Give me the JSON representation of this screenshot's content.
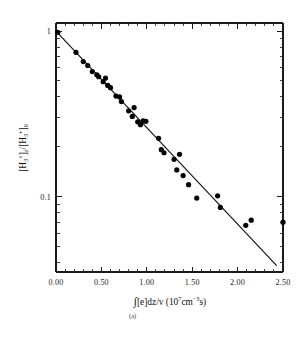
{
  "figure": {
    "caption": "(a)",
    "background_color": "#ffffff",
    "foreground_color": "#000000"
  },
  "axes": {
    "x": {
      "label_parts": {
        "integral": "∫",
        "body": "[e]dz/v  (10",
        "exp1": "7",
        "mid": "cm",
        "exp2": "−3",
        "tail": "s)"
      },
      "label_plain": "∫[e]dz/v (10⁷cm⁻³s)",
      "tick_labels": [
        "0.00",
        "0.50",
        "1.00",
        "1.50",
        "2.00",
        "2.50"
      ],
      "tick_values": [
        0.0,
        0.5,
        1.0,
        1.5,
        2.0,
        2.5
      ],
      "range": [
        0.0,
        2.5
      ],
      "scale": "linear",
      "minor_ticks_per_interval": 5
    },
    "y": {
      "label_plain": "[H₃⁺]z/[H₃⁺]₀",
      "label_parts": {
        "open1": "[H",
        "sub1": "3",
        "sup1": "+",
        "close1": "]",
        "subz": "z",
        "slash": "/[H",
        "sub2": "3",
        "sup2": "+",
        "close2": "]",
        "sub0": "0"
      },
      "tick_labels": [
        "1",
        "0.1"
      ],
      "tick_values": [
        1.0,
        0.1
      ],
      "range": [
        0.035,
        1.12
      ],
      "scale": "log"
    }
  },
  "chart_data": {
    "type": "scatter",
    "title": "",
    "xlabel": "∫[e]dz/v (10⁷cm⁻³s)",
    "ylabel": "[H₃⁺]z/[H₃⁺]₀",
    "xlim": [
      0.0,
      2.5
    ],
    "ylim": [
      0.035,
      1.12
    ],
    "yscale": "log",
    "xscale": "linear",
    "grid": false,
    "legend": null,
    "marker": "filled-circle",
    "marker_color": "#000000",
    "series": [
      {
        "name": "H3+ decay measurements",
        "type": "scatter",
        "points": [
          [
            0.02,
            0.985
          ],
          [
            0.22,
            0.745
          ],
          [
            0.3,
            0.655
          ],
          [
            0.35,
            0.62
          ],
          [
            0.4,
            0.57
          ],
          [
            0.45,
            0.545
          ],
          [
            0.47,
            0.53
          ],
          [
            0.52,
            0.495
          ],
          [
            0.545,
            0.52
          ],
          [
            0.57,
            0.47
          ],
          [
            0.6,
            0.455
          ],
          [
            0.66,
            0.405
          ],
          [
            0.7,
            0.4
          ],
          [
            0.72,
            0.375
          ],
          [
            0.8,
            0.33
          ],
          [
            0.84,
            0.305
          ],
          [
            0.86,
            0.345
          ],
          [
            0.9,
            0.283
          ],
          [
            0.93,
            0.272
          ],
          [
            0.96,
            0.287
          ],
          [
            0.99,
            0.285
          ],
          [
            1.13,
            0.225
          ],
          [
            1.16,
            0.192
          ],
          [
            1.19,
            0.184
          ],
          [
            1.3,
            0.168
          ],
          [
            1.33,
            0.145
          ],
          [
            1.36,
            0.18
          ],
          [
            1.4,
            0.134
          ],
          [
            1.46,
            0.118
          ],
          [
            1.55,
            0.098
          ],
          [
            1.78,
            0.101
          ],
          [
            1.81,
            0.086
          ],
          [
            2.09,
            0.067
          ],
          [
            2.15,
            0.072
          ],
          [
            2.5,
            0.07
          ]
        ]
      },
      {
        "name": "exponential fit",
        "type": "line",
        "endpoints": [
          [
            0.0,
            1.0
          ],
          [
            2.43,
            0.0383
          ]
        ]
      }
    ]
  }
}
